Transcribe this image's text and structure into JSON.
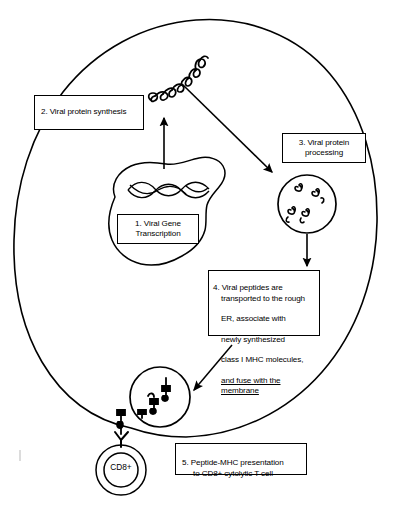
{
  "figure": {
    "background_color": "#ffffff",
    "stroke_color": "#000000",
    "width": 405,
    "height": 514
  },
  "steps": [
    {
      "id": "box-1",
      "number": "1.",
      "line1": "1.  Viral Gene",
      "line2": "Transcription",
      "full_text": "1. Viral Gene Transcription"
    },
    {
      "id": "box-2",
      "number": "2.",
      "line1": "2. Viral protein synthesis",
      "full_text": "2. Viral protein synthesis"
    },
    {
      "id": "box-3",
      "number": "3.",
      "line1": "3.  Viral protein",
      "line2": "processing",
      "full_text": "3. Viral protein processing"
    },
    {
      "id": "box-4",
      "number": "4.",
      "line1": "4. Viral peptides are",
      "line2": "transported to the rough",
      "line3": "ER, associate with",
      "line4": "newly synthesized",
      "line5": "class I MHC molecules,",
      "line6": "and fuse with the membrane",
      "full_text": "4. Viral peptides are transported to the rough ER, associate with newly synthesized class I MHC molecules, and fuse with the membrane"
    },
    {
      "id": "box-5",
      "number": "5.",
      "line1": "5.  Peptide-MHC presentation",
      "line2": "to CD8+ cytolytic T cell",
      "full_text": "5. Peptide-MHC presentation to CD8+ cytolytic T cell"
    }
  ],
  "cell_structures": {
    "cell_name": "infected-cell-outline",
    "nucleus_name": "nucleus-outline",
    "dna_name": "dna-double-helix",
    "ribosome_protein_name": "nascent-viral-protein-coil",
    "proteasome_name": "proteasome-vesicle",
    "er_vesicle_name": "er-vesicle-fusing-membrane",
    "tcell_label": "CD8+",
    "tcell_name": "cd8-t-cell"
  },
  "arrows": [
    {
      "name": "arrow-nucleus-to-protein",
      "from": "nucleus",
      "to": "viral-protein-coil",
      "direction": "up"
    },
    {
      "name": "arrow-protein-to-proteasome",
      "from": "viral-protein-coil",
      "to": "proteasome",
      "direction": "down-right"
    },
    {
      "name": "arrow-proteasome-to-step4",
      "from": "proteasome",
      "to": "step-4-box",
      "direction": "down"
    },
    {
      "name": "arrow-step4-to-vesicle",
      "from": "step-4-box",
      "to": "er-vesicle",
      "direction": "down-left"
    }
  ],
  "marks": {
    "edge_tick_name": "page-edge-tick-mark"
  }
}
